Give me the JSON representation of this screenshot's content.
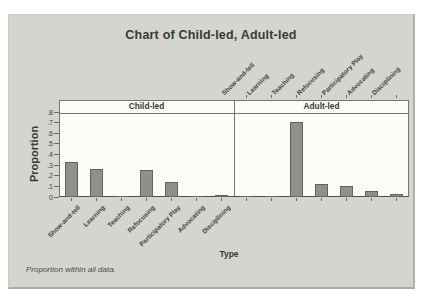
{
  "colors": {
    "chart_background": "#d5d5d0",
    "plot_background": "#fbfbf8",
    "bar_fill": "#90908a",
    "bar_border": "#63635e",
    "axis_line": "#6b6965",
    "text": "#3f3f3c"
  },
  "chart_data": {
    "type": "bar",
    "title": "Chart of Child-led, Adult-led",
    "xlabel": "Type",
    "ylabel": "Proportion",
    "footnote": "Proportion within all data.",
    "panels": [
      "Child-led",
      "Adult-led"
    ],
    "categories": [
      "Show-and-tell",
      "Learning",
      "Teaching",
      "Refocusing",
      "Participatory Play",
      "Advocating",
      "Disciplining"
    ],
    "series": [
      {
        "name": "Child-led",
        "values": [
          0.325,
          0.26,
          0.004,
          0.255,
          0.145,
          0.002,
          0.02
        ]
      },
      {
        "name": "Adult-led",
        "values": [
          0.005,
          0.005,
          0.71,
          0.12,
          0.1,
          0.055,
          0.025
        ]
      }
    ],
    "ylim": [
      0,
      0.8
    ],
    "ytick_step": 0.1,
    "ytick_labels": [
      "0",
      ".1",
      ".2",
      ".3",
      ".4",
      ".5",
      ".6",
      ".7",
      ".8"
    ],
    "grid": "off",
    "legend": "none"
  }
}
